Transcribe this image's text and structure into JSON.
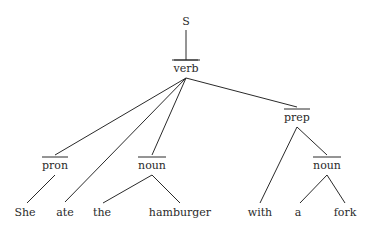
{
  "tree": {
    "root": {
      "label": "S",
      "x": 186,
      "y": 22
    },
    "nodes": {
      "verb": {
        "label": "verb",
        "x": 186,
        "y": 72,
        "bar": true
      },
      "pron": {
        "label": "pron",
        "x": 55,
        "y": 166,
        "bar": true
      },
      "noun1": {
        "label": "noun",
        "x": 152,
        "y": 166,
        "bar": true
      },
      "prep": {
        "label": "prep",
        "x": 297,
        "y": 118,
        "bar": true
      },
      "noun2": {
        "label": "noun",
        "x": 327,
        "y": 166,
        "bar": true
      }
    },
    "words": [
      {
        "label": "She",
        "x": 25
      },
      {
        "label": "ate",
        "x": 65
      },
      {
        "label": "the",
        "x": 102
      },
      {
        "label": "hamburger",
        "x": 180
      },
      {
        "label": "with",
        "x": 260
      },
      {
        "label": "a",
        "x": 298
      },
      {
        "label": "fork",
        "x": 345
      }
    ]
  }
}
